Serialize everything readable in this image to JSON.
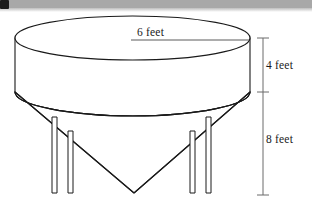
{
  "figure": {
    "type": "geometric-diagram",
    "shape": "cylinder-over-cone",
    "stroke_color": "#1a1a1a",
    "fill_color": "#ffffff",
    "background_color": "#ffffff",
    "header_bar_color": "#a8a8a8",
    "corner_mark_color": "#1d1d1d"
  },
  "labels": {
    "diameter": "6 feet",
    "cylinder_height": "4 feet",
    "cone_height": "8 feet"
  },
  "measurements": [
    {
      "name": "radius-or-diameter",
      "value": 6,
      "unit": "feet",
      "text": "6 feet",
      "orientation": "horizontal",
      "applies_to": "cylinder-top-radius"
    },
    {
      "name": "cylinder-height",
      "value": 4,
      "unit": "feet",
      "text": "4 feet",
      "orientation": "vertical",
      "applies_to": "cylinder"
    },
    {
      "name": "cone-height",
      "value": 8,
      "unit": "feet",
      "text": "8 feet",
      "orientation": "vertical",
      "applies_to": "cone"
    }
  ],
  "parts": {
    "cylinder_label": "cylinder body",
    "cone_label": "inverted cone hopper",
    "legs_label": "support legs",
    "leg_count": 4
  }
}
